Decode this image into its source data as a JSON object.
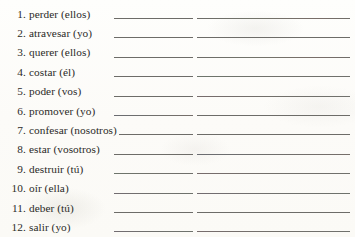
{
  "document": {
    "type": "spanish-verb-conjugation-worksheet",
    "language": "es",
    "answer_columns_per_row": 2
  },
  "exercises": [
    {
      "number": "1.",
      "prompt": "perder (ellos)",
      "verb": "perder",
      "subject": "ellos",
      "tint_a": "tint-none",
      "tint_b": "tint-warm"
    },
    {
      "number": "2.",
      "prompt": "atravesar (yo)",
      "verb": "atravesar",
      "subject": "yo",
      "tint_a": "tint-none",
      "tint_b": "tint-none"
    },
    {
      "number": "3.",
      "prompt": "querer (ellos)",
      "verb": "querer",
      "subject": "ellos",
      "tint_a": "tint-none",
      "tint_b": "tint-warm"
    },
    {
      "number": "4.",
      "prompt": "costar (él)",
      "verb": "costar",
      "subject": "él",
      "tint_a": "tint-none",
      "tint_b": "tint-green"
    },
    {
      "number": "5.",
      "prompt": "poder (vos)",
      "verb": "poder",
      "subject": "vos",
      "tint_a": "tint-none",
      "tint_b": "tint-rose"
    },
    {
      "number": "6.",
      "prompt": "promover (yo)",
      "verb": "promover",
      "subject": "yo",
      "tint_a": "tint-cool",
      "tint_b": "tint-none"
    },
    {
      "number": "7.",
      "prompt": "confesar (nosotros)",
      "verb": "confesar",
      "subject": "nosotros",
      "tint_a": "tint-none",
      "tint_b": "tint-none"
    },
    {
      "number": "8.",
      "prompt": "estar (vosotros)",
      "verb": "estar",
      "subject": "vosotros",
      "tint_a": "tint-none",
      "tint_b": "tint-cool"
    },
    {
      "number": "9.",
      "prompt": "destruir (tú)",
      "verb": "destruir",
      "subject": "tú",
      "tint_a": "tint-green",
      "tint_b": "tint-rose"
    },
    {
      "number": "10.",
      "prompt": "oír (ella)",
      "verb": "oír",
      "subject": "ella",
      "tint_a": "tint-violet",
      "tint_b": "tint-violet"
    },
    {
      "number": "11.",
      "prompt": "deber (tú)",
      "verb": "deber",
      "subject": "tú",
      "tint_a": "tint-none",
      "tint_b": "tint-none"
    },
    {
      "number": "12.",
      "prompt": "salir (yo)",
      "verb": "salir",
      "subject": "yo",
      "tint_a": "tint-violet",
      "tint_b": "tint-rose"
    }
  ],
  "colors": {
    "ink": "#2b2a28",
    "rule": "#6d6c68",
    "paper": "#fdfdfb"
  }
}
